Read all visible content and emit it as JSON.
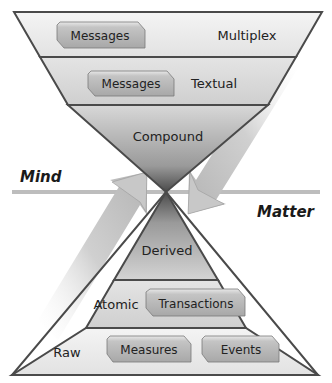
{
  "diagram": {
    "type": "hourglass",
    "upper_funnel": {
      "bands": [
        {
          "label": "Multiplex",
          "tags": [
            "Messages"
          ]
        },
        {
          "label": "Textual",
          "tags": [
            "Messages"
          ]
        },
        {
          "label": "Compound",
          "tags": []
        }
      ]
    },
    "lower_pyramid": {
      "bands": [
        {
          "label": "Derived",
          "tags": []
        },
        {
          "label": "Atomic",
          "tags": [
            "Transactions"
          ]
        },
        {
          "label": "Raw",
          "tags": [
            "Measures",
            "Events"
          ]
        }
      ]
    },
    "axis_labels": {
      "left": "Mind",
      "right": "Matter"
    },
    "arrows": [
      {
        "direction": "up-right",
        "side": "left"
      },
      {
        "direction": "down-left",
        "side": "right"
      }
    ],
    "colors": {
      "outline": "#4a4a4a",
      "band_light": "#ececec",
      "band_mid": "#d6d6d6",
      "tag_fill": "#b9b9b9",
      "divider": "#bdbdbd"
    }
  }
}
